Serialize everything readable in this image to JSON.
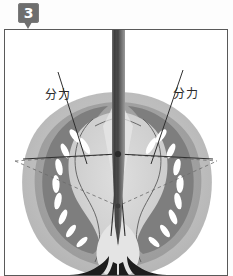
{
  "figure": {
    "step_badge": "3",
    "panel_border_color": "#595959",
    "background_color": "#ffffff"
  },
  "labels": {
    "left": {
      "text": "分力",
      "name": "component-force-label-left"
    },
    "right": {
      "text": "分力",
      "name": "component-force-label-right"
    }
  },
  "colors": {
    "badge_bg": "#6e6e6e",
    "badge_text": "#ffffff",
    "outer_tissue": "#b9b9b9",
    "mid_tissue": "#a0a0a0",
    "inner_dark": "#7c7c7c",
    "core_light": "#d6d6d6",
    "highlight": "#ffffff",
    "needle_dark": "#4a4a4a",
    "needle_light": "#8e8e8e",
    "line_color": "#3a3a3a",
    "dashed_color": "#6b6b6b",
    "black_roots": "#1c1c1c"
  },
  "diagram": {
    "type": "anatomical-cross-section-force-diagram",
    "probe": {
      "name": "vertical-probe-needle",
      "orientation": "vertical",
      "tip_point": [
        113,
        215
      ]
    },
    "pivot": {
      "name": "force-origin-point",
      "position": [
        113,
        124
      ]
    },
    "force_vectors": [
      {
        "name": "component-force-left",
        "from": [
          113,
          124
        ],
        "to": [
          30,
          129
        ]
      },
      {
        "name": "component-force-right",
        "from": [
          113,
          124
        ],
        "to": [
          196,
          129
        ]
      },
      {
        "name": "resultant-down",
        "from": [
          113,
          124
        ],
        "to": [
          113,
          205
        ]
      }
    ],
    "dashed_construction": {
      "name": "parallelogram-of-forces",
      "points": [
        [
          30,
          129
        ],
        [
          113,
          175
        ],
        [
          196,
          129
        ]
      ]
    }
  }
}
